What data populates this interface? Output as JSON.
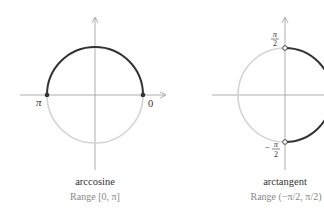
{
  "colors": {
    "highlight_arc": "#333333",
    "faded_arc": "#d4d4d4",
    "axis": "#9a9a9a",
    "title_text": "#333333",
    "range_text": "#888888"
  },
  "panels": [
    {
      "id": "arccosine",
      "title": "arccosine",
      "range_label": "Range [0, π]",
      "labels": {
        "left": "π",
        "right": "0"
      },
      "highlight": "upper half circle, closed endpoints"
    },
    {
      "id": "arctangent",
      "title": "arctangent",
      "range_label_prefix": "Range",
      "range_label": "Range (−π/2, π/2)",
      "labels": {
        "top": "π/2",
        "bottom": "−π/2"
      },
      "highlight": "right half circle, open endpoints"
    }
  ],
  "labels": {
    "pi": "π",
    "zero": "0",
    "two": "2",
    "minus": "−"
  }
}
